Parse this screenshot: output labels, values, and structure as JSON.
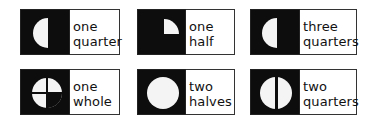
{
  "cards": [
    {
      "id": "one-quarter",
      "lines": [
        "one",
        "quarter"
      ],
      "shape": "left-half-circle"
    },
    {
      "id": "one-half",
      "lines": [
        "one",
        "half"
      ],
      "shape": "quarter-circle"
    },
    {
      "id": "three-quarters",
      "lines": [
        "three",
        "quarters"
      ],
      "shape": "left-half-circle"
    },
    {
      "id": "one-whole",
      "lines": [
        "one",
        "whole"
      ],
      "shape": "circle-with-cross"
    },
    {
      "id": "two-halves",
      "lines": [
        "two",
        "halves"
      ],
      "shape": "full-circle"
    },
    {
      "id": "two-quarters",
      "lines": [
        "two",
        "quarters"
      ],
      "shape": "circle-with-vertical-line"
    }
  ],
  "colors": {
    "dark": "#0d0d0d",
    "light": "#ffffff",
    "text": "#111111"
  }
}
